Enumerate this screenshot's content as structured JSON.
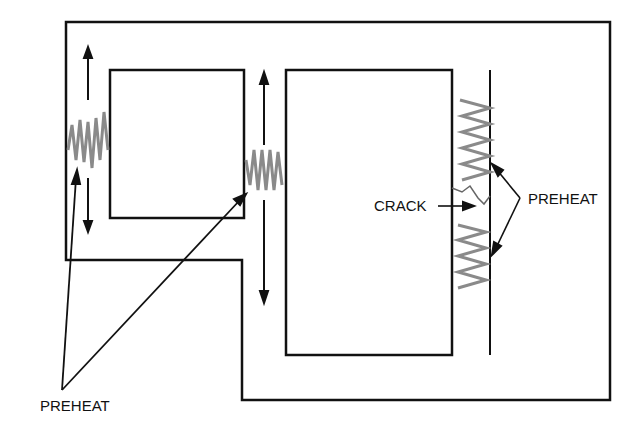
{
  "diagram": {
    "type": "weld-repair-preheat-illustration",
    "labels": {
      "preheat_left": "PREHEAT",
      "crack": "CRACK",
      "preheat_right": "PREHEAT"
    },
    "colors": {
      "outline": "#111111",
      "heat_zone": "#8a8a8a",
      "background": "#ffffff"
    }
  }
}
